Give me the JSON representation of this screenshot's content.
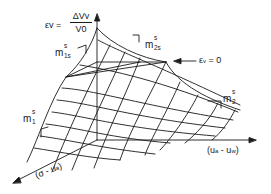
{
  "diagram": {
    "type": "3D constitutive surface",
    "equation": {
      "lhs": "εv",
      "equals": "=",
      "numerator": "ΔVv",
      "denominator": "V0"
    },
    "axes": {
      "vertical": "εv",
      "right": "(ua - uw)",
      "right_parts": {
        "open": "(u",
        "a": "a",
        "mid": " - u",
        "w": "w",
        "close": ")"
      },
      "left": "(σ - ua)",
      "left_parts": {
        "open": "(σ - u",
        "a": "a",
        "close": ")"
      }
    },
    "annotations": {
      "zero_label": "εv = 0",
      "zero_parts": {
        "eps": "ε",
        "v": "v",
        "rest": " = 0"
      }
    },
    "slopes": [
      {
        "id": "m1s",
        "base": "m",
        "sup": "s",
        "sub": "1s"
      },
      {
        "id": "m2s",
        "base": "m",
        "sup": "s",
        "sub": "2s"
      },
      {
        "id": "m2",
        "base": "m",
        "sup": "s",
        "sub": "2"
      },
      {
        "id": "m1",
        "base": "m",
        "sup": "s",
        "sub": "1"
      }
    ],
    "colors": {
      "line": "#1a1a1a",
      "background": "#ffffff"
    }
  }
}
